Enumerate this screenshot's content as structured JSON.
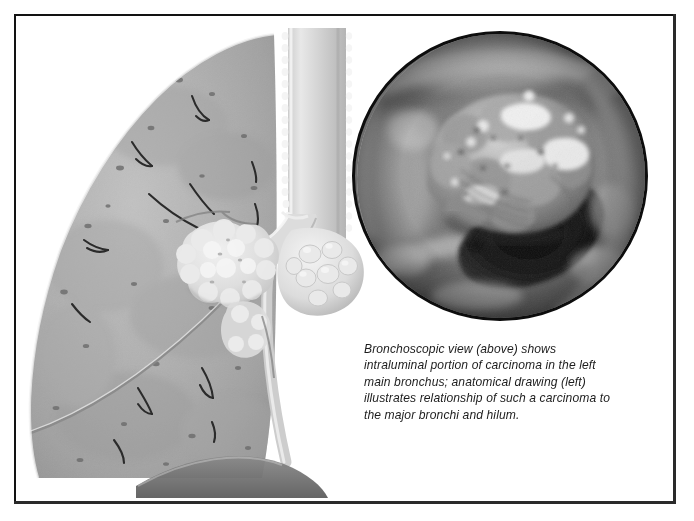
{
  "figure": {
    "kind": "medical-illustration",
    "modality_labels": [
      "anatomical-drawing",
      "bronchoscopic-photograph"
    ],
    "frame": {
      "border_color": "#121212",
      "background": "#ffffff"
    }
  },
  "bronchoscopy_panel": {
    "name": "bronchoscopic-view",
    "shape": "circle",
    "border_color": "#0d0d0d",
    "palette": {
      "lumen_dark": "#141414",
      "mucosa_mid": "#6f6f6f",
      "mucosa_light": "#b6b6b6",
      "tumor_highlight": "#f2f2f2",
      "wall_shadow": "#3a3a3a"
    },
    "depicted": "intraluminal carcinoma of the left main bronchus seen through the bronchoscope, with nodular tumour tissue occupying the upper half of the lumen and the dark patent airway below"
  },
  "anatomy_panel": {
    "name": "anatomical-drawing",
    "palette": {
      "lung_parenchyma": "#b0b0b0",
      "lung_shadow": "#8e8e8e",
      "airway_light": "#d8d8d8",
      "tumor_mass": "#e4e4e4",
      "vessel_line": "#2b2b2b",
      "diaphragm": "#6b6b6b"
    },
    "structures": [
      {
        "label": "left lung",
        "name": "lung-outline"
      },
      {
        "label": "trachea",
        "name": "trachea"
      },
      {
        "label": "carina",
        "name": "carina"
      },
      {
        "label": "left main bronchus",
        "name": "left-main-bronchus"
      },
      {
        "label": "hilum",
        "name": "hilum"
      },
      {
        "label": "carcinoma mass",
        "name": "carcinoma-mass"
      },
      {
        "label": "hilar lymph nodes",
        "name": "hilar-lymph-nodes"
      },
      {
        "label": "pulmonary vessels",
        "name": "pulmonary-vessels"
      },
      {
        "label": "diaphragm",
        "name": "diaphragm"
      }
    ]
  },
  "caption": {
    "lines": [
      "Bronchoscopic view (above) shows",
      "intraluminal portion of carcinoma in the left",
      "main bronchus; anatomical drawing (left)",
      "illustrates relationship of such a carcinoma to",
      "the major bronchi and hilum."
    ],
    "full_text": "Bronchoscopic view (above) shows intraluminal portion of carcinoma in the left main bronchus; anatomical drawing (left) illustrates relationship of such a carcinoma to the major bronchi and hilum.",
    "style": "italic",
    "color": "#1d1d1d"
  }
}
